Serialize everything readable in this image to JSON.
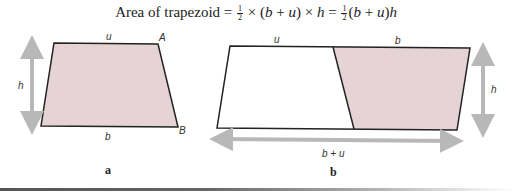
{
  "formula": {
    "prefix": "Area of trapezoid = ",
    "half_num": "1",
    "half_den": "2",
    "part1": " × (",
    "b": "b",
    "plus": " + ",
    "u": "u",
    "part2": ") × ",
    "h": "h",
    "eq": " = ",
    "part3": "(",
    "part4": ")"
  },
  "figure_a": {
    "caption": "a",
    "labels": {
      "top": "u",
      "bottom": "b",
      "height": "h",
      "corner_top_right": "A",
      "corner_bottom_right": "B"
    }
  },
  "figure_b": {
    "caption": "b",
    "labels": {
      "top_left": "u",
      "top_right": "b",
      "height": "h",
      "width": "b + u"
    }
  },
  "colors": {
    "fill": "#e6d3d6",
    "stroke": "#222222",
    "arrow": "#b8b8b8"
  }
}
